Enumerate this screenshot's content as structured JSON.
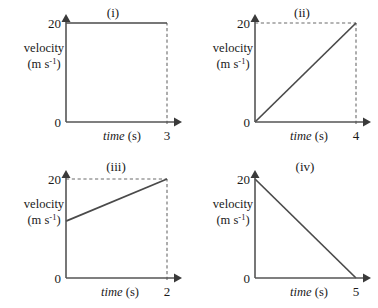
{
  "figure": {
    "title": "",
    "panel_count": 4,
    "axis_labels": {
      "y_name": "velocity",
      "y_units": "(m s",
      "y_units_exp": "-1",
      "y_units_close": ")",
      "x_name": "time",
      "x_units": "(s)"
    },
    "colors": {
      "axis": "#555555",
      "data_line": "#4a4a4a",
      "guide_line": "#6b6b6b",
      "text": "#1a1a1a",
      "background": "#ffffff"
    }
  },
  "chart_data": [
    {
      "id": "i",
      "panel_label": "(i)",
      "type": "line",
      "title": "(i)",
      "xlabel": "time (s)",
      "ylabel": "velocity (m s-1)",
      "x": [
        0,
        3
      ],
      "y": [
        20,
        20
      ],
      "xlim": [
        0,
        3
      ],
      "ylim": [
        0,
        20
      ],
      "x_ticks": [
        "0",
        "3"
      ],
      "y_ticks": [
        "0",
        "20"
      ],
      "x_tick_values": [
        0,
        3
      ],
      "y_tick_values": [
        0,
        20
      ],
      "grid": false,
      "legend": "none",
      "guides": [
        {
          "kind": "vertical",
          "at_x": 3,
          "from_y": 0,
          "to_y": 20
        }
      ],
      "description": "Constant velocity 20 m/s from 0 s to 3 s"
    },
    {
      "id": "ii",
      "panel_label": "(ii)",
      "type": "line",
      "title": "(ii)",
      "xlabel": "time (s)",
      "ylabel": "velocity (m s-1)",
      "x": [
        0,
        4
      ],
      "y": [
        0,
        20
      ],
      "xlim": [
        0,
        4
      ],
      "ylim": [
        0,
        20
      ],
      "x_ticks": [
        "0",
        "4"
      ],
      "y_ticks": [
        "0",
        "20"
      ],
      "x_tick_values": [
        0,
        4
      ],
      "y_tick_values": [
        0,
        20
      ],
      "grid": false,
      "legend": "none",
      "guides": [
        {
          "kind": "horizontal",
          "at_y": 20,
          "from_x": 0,
          "to_x": 4
        },
        {
          "kind": "vertical",
          "at_x": 4,
          "from_y": 0,
          "to_y": 20
        }
      ],
      "description": "Uniform acceleration from 0 to 20 m/s over 4 s"
    },
    {
      "id": "iii",
      "panel_label": "(iii)",
      "type": "line",
      "title": "(iii)",
      "xlabel": "time (s)",
      "ylabel": "velocity (m s-1)",
      "x": [
        0,
        2
      ],
      "y": [
        11.5,
        20
      ],
      "xlim": [
        0,
        2
      ],
      "ylim": [
        0,
        20
      ],
      "x_ticks": [
        "0",
        "2"
      ],
      "y_ticks": [
        "0",
        "20"
      ],
      "x_tick_values": [
        0,
        2
      ],
      "y_tick_values": [
        0,
        20
      ],
      "grid": false,
      "legend": "none",
      "guides": [
        {
          "kind": "horizontal",
          "at_y": 20,
          "from_x": 0,
          "to_x": 2
        },
        {
          "kind": "vertical",
          "at_x": 2,
          "from_y": 0,
          "to_y": 20
        }
      ],
      "description": "Acceleration from about 11.5 m/s to 20 m/s over 2 s"
    },
    {
      "id": "iv",
      "panel_label": "(iv)",
      "type": "line",
      "title": "(iv)",
      "xlabel": "time (s)",
      "ylabel": "velocity (m s-1)",
      "x": [
        0,
        5
      ],
      "y": [
        20,
        0
      ],
      "xlim": [
        0,
        5
      ],
      "ylim": [
        0,
        20
      ],
      "x_ticks": [
        "0",
        "5"
      ],
      "y_ticks": [
        "0",
        "20"
      ],
      "x_tick_values": [
        0,
        5
      ],
      "y_tick_values": [
        0,
        20
      ],
      "grid": false,
      "legend": "none",
      "guides": [],
      "description": "Uniform deceleration from 20 m/s to 0 over 5 s"
    }
  ]
}
